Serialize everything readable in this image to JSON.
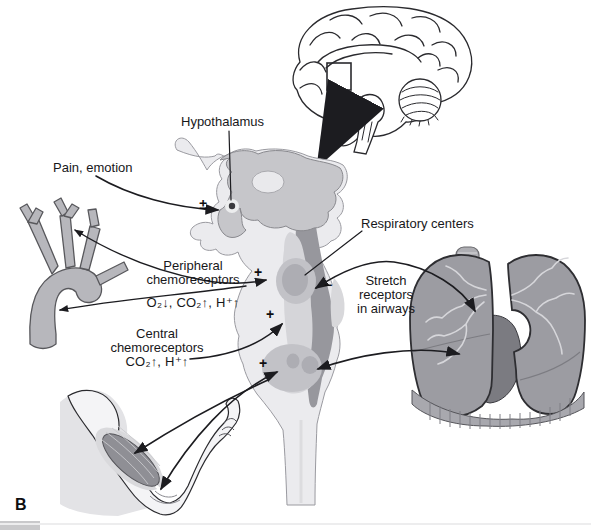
{
  "figure": {
    "panel_label": "B",
    "labels": {
      "hypothalamus": "Hypothalamus",
      "pain_emotion": "Pain, emotion",
      "respiratory_centers": "Respiratory centers",
      "peripheral_line1": "Peripheral",
      "peripheral_line2": "chemoreceptors",
      "peripheral_formula": "O₂↓, CO₂↑, H⁺↑",
      "central_line1": "Central",
      "central_line2": "chemoreceptors",
      "central_formula": "CO₂↑, H⁺↑",
      "stretch_line1": "Stretch",
      "stretch_line2": "receptors",
      "stretch_line3": "in airways"
    },
    "signs": {
      "pain": "±",
      "peripheral": "+",
      "stretch": "−",
      "central": "+",
      "muscle": "+"
    },
    "colors": {
      "line": "#2a2a2e",
      "arrow": "#1c1c20",
      "brainstem_light": "#ebebee",
      "brainstem_mid": "#d5d5d9",
      "thalamus": "#c6c6ca",
      "dark_band": "#97979d",
      "center_outer": "#c2c2c7",
      "center_inner": "#adadb3",
      "vessel": "#b7b7bc",
      "muscle": "#8f8f95",
      "muscle_sheath": "#d9d9dc",
      "skin_shadow": "#e3e3e6",
      "lung": "#9c9ca2",
      "heart": "#7b7b81",
      "diaphragm": "#a8a8ae",
      "tree": "#d6d6da"
    }
  }
}
